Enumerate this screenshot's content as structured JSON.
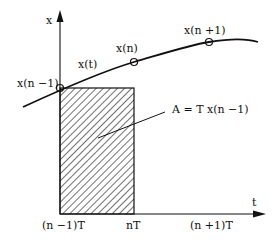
{
  "diagram": {
    "axes": {
      "y_label": "x",
      "x_label": "t"
    },
    "curve_label": "x(t)",
    "points": [
      {
        "label": "x(n −1)"
      },
      {
        "label": "x(n)"
      },
      {
        "label": "x(n +1)"
      }
    ],
    "area_label": "A = T x(n −1)",
    "ticks": [
      {
        "label": "(n −1)T"
      },
      {
        "label": "nT"
      },
      {
        "label": "(n +1)T"
      }
    ],
    "colors": {
      "stroke": "#111111",
      "background": "#ffffff"
    }
  }
}
